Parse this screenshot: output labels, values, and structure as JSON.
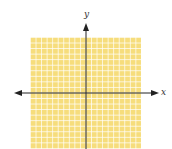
{
  "diagram": {
    "type": "coordinate-plane",
    "x_axis_label": "x",
    "y_axis_label": "y",
    "grid": {
      "rows": 20,
      "cols": 20,
      "fill_color": "#f6dd7c",
      "line_color": "#ffffff"
    },
    "axis_color": "#222222"
  }
}
